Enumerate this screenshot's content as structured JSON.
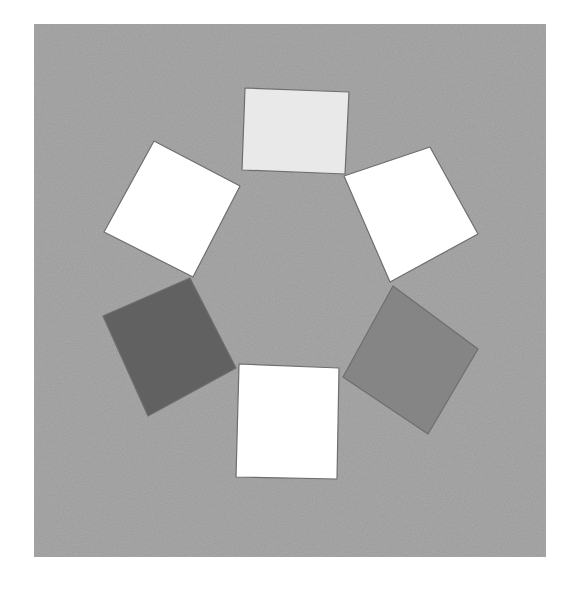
{
  "figure": {
    "background": {
      "color": "#a9a9a9",
      "x": 34,
      "y": 24,
      "width": 512,
      "height": 533
    },
    "arrangement": "six squares around a central hexagon",
    "squares": [
      {
        "name": "top",
        "color": "#e9e9e9",
        "points": "245,88 349,92 345,174 242,170"
      },
      {
        "name": "top-right",
        "color": "#ffffff",
        "points": "344,176 430,147 478,234 390,282"
      },
      {
        "name": "bottom-right",
        "color": "#858585",
        "points": "393,286 478,349 428,434 343,377"
      },
      {
        "name": "bottom",
        "color": "#ffffff",
        "points": "239,364 339,368 337,479 236,477"
      },
      {
        "name": "bottom-left",
        "color": "#616161",
        "points": "103,316 190,278 236,368 148,416"
      },
      {
        "name": "top-left",
        "color": "#ffffff",
        "points": "154,141 240,186 193,277 104,232"
      }
    ]
  }
}
